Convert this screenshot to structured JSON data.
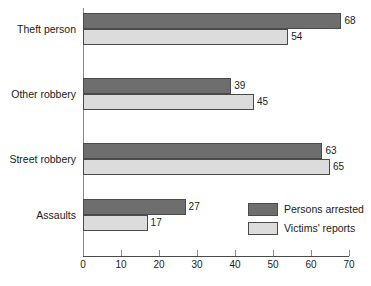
{
  "chart_data": {
    "type": "bar",
    "orientation": "horizontal",
    "title": "",
    "xlabel": "",
    "ylabel": "",
    "categories": [
      "Theft person",
      "Other robbery",
      "Street robbery",
      "Assaults"
    ],
    "series": [
      {
        "name": "Persons arrested",
        "color": "#6e6e6e",
        "values": [
          68,
          39,
          63,
          27
        ]
      },
      {
        "name": "Victims' reports",
        "color": "#dcdcdc",
        "values": [
          54,
          45,
          65,
          17
        ]
      }
    ],
    "xlim": [
      0,
      70
    ],
    "xticks": [
      0,
      10,
      20,
      30,
      40,
      50,
      60,
      70
    ],
    "xtick_labels": [
      "0",
      "10",
      "20",
      "30",
      "40",
      "50",
      "60",
      "70"
    ],
    "grid": false,
    "data_labels": true,
    "legend_position": "inside-bottom-right",
    "legend_entries": [
      "Persons arrested",
      "Victims' reports"
    ]
  },
  "colors": {
    "arrested": "#6e6e6e",
    "reports": "#dcdcdc",
    "outline": "#4a4a4a",
    "axis": "#8a8a8a",
    "text": "#1a1a1a",
    "background": "#ffffff"
  }
}
